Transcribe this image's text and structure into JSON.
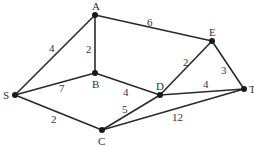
{
  "nodes": [
    {
      "id": "A",
      "label": "A",
      "x": 95,
      "y": 15,
      "lx": 92,
      "ly": 10
    },
    {
      "id": "E",
      "label": "E",
      "x": 212,
      "y": 41,
      "lx": 209,
      "ly": 36
    },
    {
      "id": "S",
      "label": "S",
      "x": 15,
      "y": 95,
      "lx": 3,
      "ly": 99
    },
    {
      "id": "B",
      "label": "B",
      "x": 95,
      "y": 73,
      "lx": 92,
      "ly": 88
    },
    {
      "id": "D",
      "label": "D",
      "x": 160,
      "y": 95,
      "lx": 156,
      "ly": 90
    },
    {
      "id": "T",
      "label": "T",
      "x": 244,
      "y": 89,
      "lx": 249,
      "ly": 93
    },
    {
      "id": "C",
      "label": "C",
      "x": 102,
      "y": 130,
      "lx": 98,
      "ly": 145
    }
  ],
  "edges": [
    {
      "from": "S",
      "to": "A",
      "weight": "4",
      "wx": 49,
      "wy": 52
    },
    {
      "from": "A",
      "to": "B",
      "weight": "2",
      "wx": 86,
      "wy": 53
    },
    {
      "from": "A",
      "to": "E",
      "weight": "6",
      "wx": 147,
      "wy": 26
    },
    {
      "from": "S",
      "to": "B",
      "weight": "7",
      "wx": 59,
      "wy": 92
    },
    {
      "from": "S",
      "to": "C",
      "weight": "2",
      "wx": 51,
      "wy": 123
    },
    {
      "from": "B",
      "to": "D",
      "weight": "4",
      "wx": 123,
      "wy": 96
    },
    {
      "from": "E",
      "to": "D",
      "weight": "2",
      "wx": 183,
      "wy": 66
    },
    {
      "from": "E",
      "to": "T",
      "weight": "3",
      "wx": 221,
      "wy": 74
    },
    {
      "from": "D",
      "to": "T",
      "weight": "4",
      "wx": 203,
      "wy": 88
    },
    {
      "from": "C",
      "to": "D",
      "weight": "5",
      "wx": 122,
      "wy": 113
    },
    {
      "from": "C",
      "to": "T",
      "weight": "12",
      "wx": 172,
      "wy": 121
    }
  ]
}
